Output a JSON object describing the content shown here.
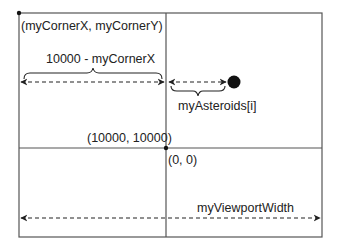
{
  "diagram": {
    "labels": {
      "corner": "(myCornerX, myCornerY)",
      "distance": "10000 - myCornerX",
      "asteroid": "myAsteroids[i]",
      "wrap_point_left": "(10000, 10000)",
      "origin": "(0, 0)",
      "viewport_width": "myViewportWidth"
    },
    "colors": {
      "line": "#555555",
      "text": "#222222",
      "dot": "#111111"
    }
  }
}
